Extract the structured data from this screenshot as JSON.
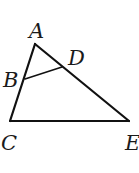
{
  "diagram": {
    "type": "geometry-triangle",
    "points": {
      "A": {
        "label": "A",
        "x": 35,
        "y": 44,
        "label_x": 29,
        "label_y": 38
      },
      "B": {
        "label": "B",
        "x": 25,
        "y": 79,
        "label_x": 3,
        "label_y": 87
      },
      "C": {
        "label": "C",
        "x": 10,
        "y": 121,
        "label_x": 1,
        "label_y": 150
      },
      "D": {
        "label": "D",
        "x": 62,
        "y": 67,
        "label_x": 68,
        "label_y": 65
      },
      "E": {
        "label": "E",
        "x": 129,
        "y": 121,
        "label_x": 125,
        "label_y": 150
      }
    },
    "segments": [
      {
        "from": "A",
        "to": "C",
        "name": "side-AC"
      },
      {
        "from": "A",
        "to": "E",
        "name": "side-AE"
      },
      {
        "from": "C",
        "to": "E",
        "name": "side-CE"
      },
      {
        "from": "B",
        "to": "D",
        "name": "segment-BD"
      }
    ],
    "colors": {
      "line": "#111111",
      "label": "#1a1a1a",
      "background": "#ffffff"
    }
  }
}
